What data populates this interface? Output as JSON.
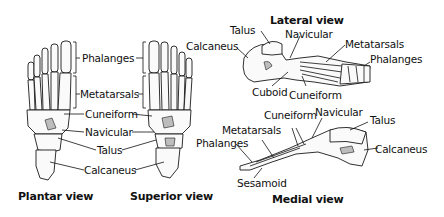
{
  "diagram": {
    "views": [
      {
        "id": "plantar",
        "title": "Plantar view",
        "labels": [
          "Phalanges",
          "Metatarsals",
          "Cuneiform",
          "Navicular",
          "Talus",
          "Calcaneus"
        ]
      },
      {
        "id": "superior",
        "title": "Superior view",
        "labels": [
          "Phalanges",
          "Metatarsals",
          "Cuneiform",
          "Navicular",
          "Talus",
          "Calcaneus"
        ]
      },
      {
        "id": "lateral",
        "title": "Lateral view",
        "labels": [
          "Talus",
          "Calcaneus",
          "Navicular",
          "Metatarsals",
          "Phalanges",
          "Cuboid",
          "Cuneiform"
        ]
      },
      {
        "id": "medial",
        "title": "Medial view",
        "labels": [
          "Metatarsals",
          "Phalanges",
          "Cuneiform",
          "Navicular",
          "Talus",
          "Calcaneus",
          "Sesamoid"
        ]
      }
    ],
    "shared_labels": {
      "phalanges": "Phalanges",
      "metatarsals": "Metatarsals",
      "cuneiform": "Cuneiform",
      "navicular": "Navicular",
      "talus": "Talus",
      "calcaneus": "Calcaneus"
    },
    "lateral": {
      "title": "Lateral view",
      "talus": "Talus",
      "calcaneus": "Calcaneus",
      "navicular": "Navicular",
      "metatarsals": "Metatarsals",
      "phalanges": "Phalanges",
      "cuboid": "Cuboid",
      "cuneiform": "Cuneiform"
    },
    "medial": {
      "title": "Medial view",
      "metatarsals": "Metatarsals",
      "phalanges": "Phalanges",
      "cuneiform": "Cuneiform",
      "navicular": "Navicular",
      "talus": "Talus",
      "calcaneus": "Calcaneus",
      "sesamoid": "Sesamoid"
    },
    "plantar_title": "Plantar view",
    "superior_title": "Superior view"
  }
}
